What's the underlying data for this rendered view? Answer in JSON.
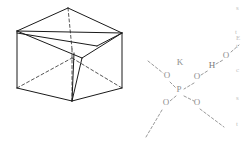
{
  "figure": {
    "caption": "",
    "panels": [
      {
        "id": "left",
        "name": "wireframe-box-diagram",
        "description": "3D wireframe rectangular prism with internal diagonal lines"
      },
      {
        "id": "right",
        "name": "chemical-structure-diagram",
        "description": "Faint chemical structure: potassium dihydrogen phosphate fragment with hydrogen bond"
      }
    ]
  },
  "box": {
    "label": "",
    "vertices": {
      "top": "68,8",
      "left": "17,31",
      "right": "122,33",
      "back": "72,49",
      "bottom_left": "17,88",
      "bottom_front": "72,101",
      "bottom_right": "122,88",
      "inner": "82,58"
    }
  },
  "molecule": {
    "atoms": [
      {
        "id": "a1",
        "label": "K",
        "x": 180,
        "y": 65
      },
      {
        "id": "a2",
        "label": "O",
        "x": 167,
        "y": 78
      },
      {
        "id": "a3",
        "label": "O",
        "x": 197,
        "y": 79
      },
      {
        "id": "a4",
        "label": "P",
        "x": 179,
        "y": 92
      },
      {
        "id": "a5",
        "label": "O",
        "x": 166,
        "y": 105
      },
      {
        "id": "a6",
        "label": "O",
        "x": 197,
        "y": 105
      },
      {
        "id": "a7",
        "label": "H",
        "x": 212,
        "y": 68
      },
      {
        "id": "a8",
        "label": "O",
        "x": 226,
        "y": 58
      }
    ],
    "bonds": [
      {
        "from": "a2",
        "to": "a4",
        "style": "dashed"
      },
      {
        "from": "a3",
        "to": "a4",
        "style": "dashed"
      },
      {
        "from": "a4",
        "to": "a5",
        "style": "dashed"
      },
      {
        "from": "a4",
        "to": "a6",
        "style": "dashed"
      },
      {
        "from": "a3",
        "to": "a7",
        "style": "dashed"
      },
      {
        "from": "a7",
        "to": "a8",
        "style": "dashed"
      }
    ],
    "open_bonds": [
      {
        "name": "bond-upper-left-open",
        "x1": 148,
        "y1": 61,
        "x2": 163,
        "y2": 73
      },
      {
        "name": "bond-lower-left-open",
        "x1": 146,
        "y1": 137,
        "x2": 162,
        "y2": 110
      },
      {
        "name": "bond-lower-right-open",
        "x1": 200,
        "y1": 109,
        "x2": 224,
        "y2": 127
      },
      {
        "name": "bond-right-upper-open",
        "x1": 231,
        "y1": 52,
        "x2": 238,
        "y2": 45
      }
    ]
  },
  "edge_fragments": [
    {
      "name": "edge-text-1",
      "text": "s",
      "x": 236,
      "y": 10
    },
    {
      "name": "edge-text-2",
      "text": "t",
      "x": 235,
      "y": 34
    },
    {
      "name": "edge-text-3",
      "text": "E",
      "x": 236,
      "y": 40
    },
    {
      "name": "edge-text-4",
      "text": "t",
      "x": 236,
      "y": 48
    },
    {
      "name": "edge-text-5",
      "text": "c",
      "x": 236,
      "y": 72
    },
    {
      "name": "edge-text-6",
      "text": "s",
      "x": 236,
      "y": 100
    },
    {
      "name": "edge-text-7",
      "text": "t",
      "x": 236,
      "y": 126
    }
  ],
  "colors": {
    "ink": "#1a1a1a",
    "faint": "#9a9a9a",
    "edge": "#c2c2c2",
    "background": "#ffffff"
  }
}
